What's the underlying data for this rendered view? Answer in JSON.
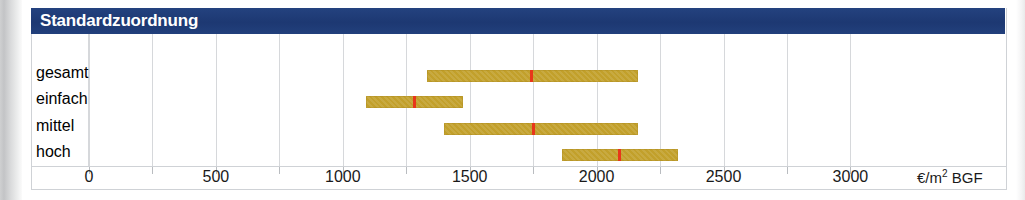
{
  "header": {
    "title": "Standardzuordnung",
    "background_color": "#1f3d7a",
    "text_color": "#ffffff"
  },
  "axis": {
    "unit_label": "€/m² BGF",
    "unit_prefix": "€/m",
    "unit_superscript": "2",
    "unit_suffix": " BGF"
  },
  "colors": {
    "bar": "#c2a02b",
    "marker": "#e8361a",
    "grid": "#d6d8db",
    "header": "#1f3d7a",
    "frame": "#cfd2d6"
  },
  "chart_data": {
    "type": "bar",
    "orientation": "horizontal",
    "subtype": "range-bar-with-median-marker",
    "title": "Standardzuordnung",
    "xlabel": "€/m² BGF",
    "ylabel": "",
    "xlim": [
      0,
      3250
    ],
    "grid": true,
    "legend": "none",
    "xticks": [
      0,
      250,
      500,
      750,
      1000,
      1250,
      1500,
      1750,
      2000,
      2250,
      2500,
      2750,
      3000
    ],
    "xtick_labels_shown": [
      {
        "value": 0,
        "label": "0"
      },
      {
        "value": 500,
        "label": "500"
      },
      {
        "value": 1000,
        "label": "1000"
      },
      {
        "value": 1500,
        "label": "1500"
      },
      {
        "value": 2000,
        "label": "2000"
      },
      {
        "value": 2500,
        "label": "2500"
      },
      {
        "value": 3000,
        "label": "3000"
      }
    ],
    "categories": [
      "gesamt",
      "einfach",
      "mittel",
      "hoch"
    ],
    "series": [
      {
        "name": "Spannweite",
        "ranges": [
          {
            "category": "gesamt",
            "from": 1330,
            "to": 2165,
            "marker": 1740
          },
          {
            "category": "einfach",
            "from": 1090,
            "to": 1475,
            "marker": 1280
          },
          {
            "category": "mittel",
            "from": 1400,
            "to": 2165,
            "marker": 1750
          },
          {
            "category": "hoch",
            "from": 1865,
            "to": 2320,
            "marker": 2090
          }
        ]
      }
    ]
  },
  "rows": [
    {
      "label": "gesamt",
      "from": 1330,
      "to": 2165,
      "marker": 1740
    },
    {
      "label": "einfach",
      "from": 1090,
      "to": 1475,
      "marker": 1280
    },
    {
      "label": "mittel",
      "from": 1400,
      "to": 2165,
      "marker": 1750
    },
    {
      "label": "hoch",
      "from": 1865,
      "to": 2320,
      "marker": 2090
    }
  ]
}
